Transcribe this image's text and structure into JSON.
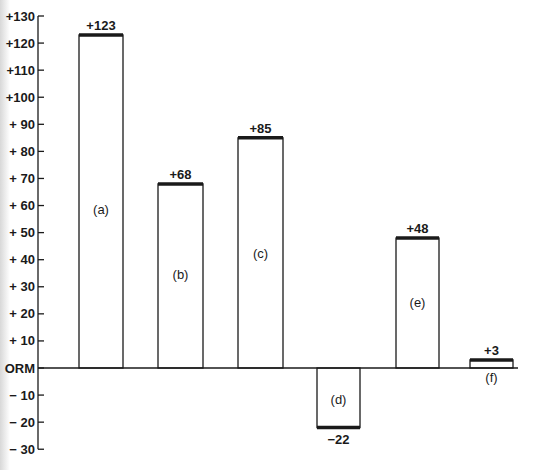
{
  "chart_data": {
    "type": "bar",
    "title": "",
    "xlabel": "",
    "ylabel": "",
    "categories": [
      "(a)",
      "(b)",
      "(c)",
      "(d)",
      "(e)",
      "(f)"
    ],
    "values": [
      123,
      68,
      85,
      -22,
      48,
      3
    ],
    "value_labels": [
      "+123",
      "+68",
      "+85",
      "−22",
      "+48",
      "+3"
    ],
    "ylim": [
      -30,
      130
    ],
    "yticks": [
      130,
      120,
      110,
      100,
      90,
      80,
      70,
      60,
      50,
      40,
      30,
      20,
      10,
      0,
      -10,
      -20,
      -30
    ],
    "ytick_labels": [
      "+130",
      "+120",
      "+110",
      "+100",
      "+ 90",
      "+ 80",
      "+ 70",
      "+ 60",
      "+ 50",
      "+ 40",
      "+ 30",
      "+ 20",
      "+ 10",
      "ORM",
      "− 10",
      "− 20",
      "− 30"
    ],
    "grid": false,
    "legend": null,
    "baseline_label": "ORM"
  },
  "style": {
    "line_color": "#1a1a1a",
    "bar_fill": "#ffffff",
    "background": "#ffffff"
  }
}
